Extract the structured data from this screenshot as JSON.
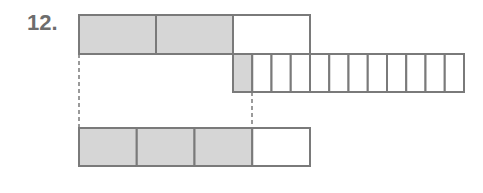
{
  "problem_label": "12.",
  "colors": {
    "shade": "#d6d6d6",
    "stroke": "#7a7a7a",
    "empty": "#ffffff"
  },
  "bars": [
    {
      "name": "top-bar",
      "x": 79,
      "y": 15,
      "w": 231,
      "h": 39,
      "segments": 3,
      "shaded": [
        0,
        1
      ]
    },
    {
      "name": "middle-bar",
      "x": 233,
      "y": 54,
      "w": 231,
      "h": 38,
      "segments": 12,
      "shaded": [
        0
      ]
    },
    {
      "name": "bottom-bar",
      "x": 79,
      "y": 128,
      "w": 231,
      "h": 38,
      "segments": 4,
      "shaded": [
        0,
        1,
        2
      ]
    }
  ],
  "dashed_lines": [
    {
      "x": 79,
      "y1": 54,
      "y2": 128
    },
    {
      "x": 252,
      "y1": 92,
      "y2": 128
    }
  ]
}
